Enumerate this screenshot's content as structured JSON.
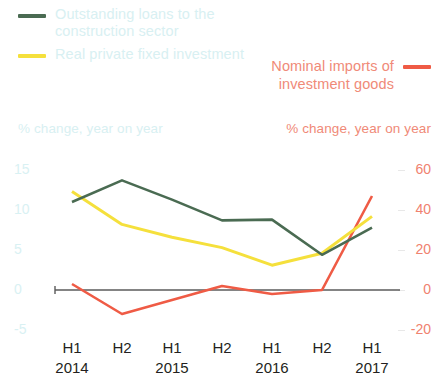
{
  "legend": {
    "left": [
      {
        "label": "Outstanding loans to the construction sector",
        "color": "#4a6b52"
      },
      {
        "label": "Real private fixed investment",
        "color": "#f5e03c"
      }
    ],
    "right": [
      {
        "label": "Nominal imports of investment goods",
        "color": "#ef5b45"
      }
    ]
  },
  "axes": {
    "left_caption": "% change, year on year",
    "right_caption": "% change, year on year",
    "left_ticks": [
      "15",
      "10",
      "5",
      "0",
      "-5"
    ],
    "right_ticks": [
      "60",
      "40",
      "20",
      "0",
      "-20"
    ]
  },
  "x_labels": {
    "halves": [
      "H1",
      "H2",
      "H1",
      "H2",
      "H1",
      "H2",
      "H1"
    ],
    "years": [
      {
        "text": "2014",
        "index": 0
      },
      {
        "text": "2015",
        "index": 2
      },
      {
        "text": "2016",
        "index": 4
      },
      {
        "text": "2017",
        "index": 6
      }
    ]
  },
  "chart_data": {
    "type": "line",
    "title": "",
    "xlabel": "",
    "ylabel": "% change, year on year",
    "grid": false,
    "legend_position": "top",
    "categories": [
      "H1 2014",
      "H2 2014",
      "H1 2015",
      "H2 2015",
      "H1 2016",
      "H2 2016",
      "H1 2017"
    ],
    "axes": [
      {
        "id": "left",
        "label": "% change, year on year",
        "ylim": [
          -5,
          15
        ],
        "ticks": [
          -5,
          0,
          5,
          10,
          15
        ],
        "color": "#d9f1f3"
      },
      {
        "id": "right",
        "label": "% change, year on year",
        "ylim": [
          -20,
          60
        ],
        "ticks": [
          -20,
          0,
          20,
          40,
          60
        ],
        "color": "#f0826f"
      }
    ],
    "series": [
      {
        "name": "Outstanding loans to the construction sector",
        "axis": "left",
        "color": "#4a6b52",
        "values": [
          11.0,
          13.7,
          11.3,
          8.7,
          8.8,
          4.4,
          7.8
        ]
      },
      {
        "name": "Real private fixed investment",
        "axis": "left",
        "color": "#f5e03c",
        "values": [
          12.3,
          8.2,
          6.6,
          5.3,
          3.1,
          4.6,
          9.2
        ]
      },
      {
        "name": "Nominal imports of investment goods",
        "axis": "right",
        "color": "#ef5b45",
        "values": [
          3.0,
          -12.0,
          -5.0,
          2.0,
          -2.0,
          0.0,
          47.0
        ]
      }
    ]
  }
}
